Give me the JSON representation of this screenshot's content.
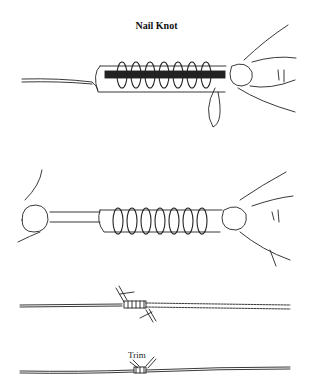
{
  "title": "Nail Knot",
  "steps": [
    {
      "id": 1,
      "description": "Line coiled around nail and leader, held by fingers"
    },
    {
      "id": 2,
      "description": "Coils tightened, both ends held"
    },
    {
      "id": 3,
      "description": "Knot drawn tight on line"
    },
    {
      "id": 4,
      "description": "Ends trimmed",
      "label": "Trim"
    }
  ],
  "colors": {
    "ink": "#222222",
    "background": "#ffffff"
  }
}
